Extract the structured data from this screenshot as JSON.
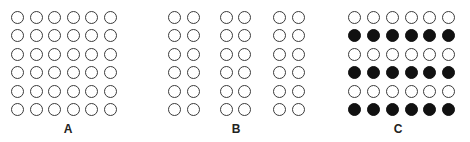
{
  "figure": {
    "panels": [
      {
        "label": "A",
        "label_x": 68,
        "columns_x": [
          17,
          36,
          54,
          73,
          91,
          110
        ],
        "rows_y": [
          17,
          35,
          54,
          72,
          91,
          109
        ],
        "filled_rows": []
      },
      {
        "label": "B",
        "label_x": 236,
        "columns_x": [
          174,
          193,
          226,
          244,
          279,
          298
        ],
        "rows_y": [
          17,
          35,
          54,
          72,
          91,
          109
        ],
        "filled_rows": []
      },
      {
        "label": "C",
        "label_x": 398,
        "columns_x": [
          354,
          373,
          392,
          411,
          429,
          448
        ],
        "rows_y": [
          17,
          35,
          54,
          72,
          91,
          109
        ],
        "filled_rows": [
          1,
          3,
          5
        ]
      }
    ],
    "colors": {
      "outline": "#3a3a3a",
      "fill": "#111111",
      "background": "#ffffff"
    }
  }
}
